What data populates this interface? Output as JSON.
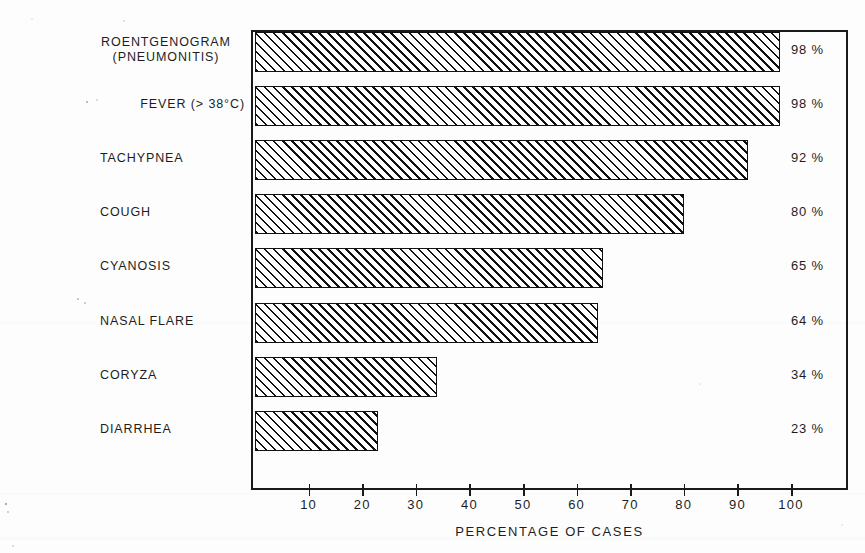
{
  "chart_data": {
    "type": "bar",
    "orientation": "horizontal",
    "title": "",
    "xlabel": "PERCENTAGE OF CASES",
    "ylabel": "",
    "xlim": [
      0,
      111
    ],
    "xticks": [
      10,
      20,
      30,
      40,
      50,
      60,
      70,
      80,
      90,
      100
    ],
    "xticklabels": [
      "10",
      "20",
      "30",
      "40",
      "50",
      "60",
      "70",
      "80",
      "90",
      "100"
    ],
    "grid": false,
    "legend": null,
    "categories": [
      "ROENTGENOGRAM (PNEUMONITIS)",
      "FEVER (> 38°C)",
      "TACHYPNEA",
      "COUGH",
      "CYANOSIS",
      "NASAL FLARE",
      "CORYZA",
      "DIARRHEA"
    ],
    "values": [
      98,
      98,
      92,
      80,
      65,
      64,
      34,
      23
    ],
    "value_labels": [
      "98 %",
      "98 %",
      "92 %",
      "80 %",
      "65 %",
      "64 %",
      "34 %",
      "23 %"
    ],
    "bars": [
      {
        "label_line1": "ROENTGENOGRAM",
        "label_line2": "(PNEUMONITIS)",
        "value": 98,
        "value_label": "98 %",
        "label_style": "two-line"
      },
      {
        "label_line1": "FEVER (> 38°C)",
        "label_line2": "",
        "value": 98,
        "value_label": "98 %",
        "label_style": "right-al"
      },
      {
        "label_line1": "TACHYPNEA",
        "label_line2": "",
        "value": 92,
        "value_label": "92 %",
        "label_style": "left"
      },
      {
        "label_line1": "COUGH",
        "label_line2": "",
        "value": 80,
        "value_label": "80 %",
        "label_style": "left"
      },
      {
        "label_line1": "CYANOSIS",
        "label_line2": "",
        "value": 65,
        "value_label": "65 %",
        "label_style": "left"
      },
      {
        "label_line1": "NASAL FLARE",
        "label_line2": "",
        "value": 64,
        "value_label": "64 %",
        "label_style": "left"
      },
      {
        "label_line1": "CORYZA",
        "label_line2": "",
        "value": 34,
        "value_label": "34 %",
        "label_style": "left"
      },
      {
        "label_line1": "DIARRHEA",
        "label_line2": "",
        "value": 23,
        "value_label": "23 %",
        "label_style": "left"
      }
    ],
    "colors": {
      "ink": "#111111",
      "background": "#fdfdfd",
      "bar_fill": "#ffffff",
      "bar_hatch": "#111111"
    }
  }
}
